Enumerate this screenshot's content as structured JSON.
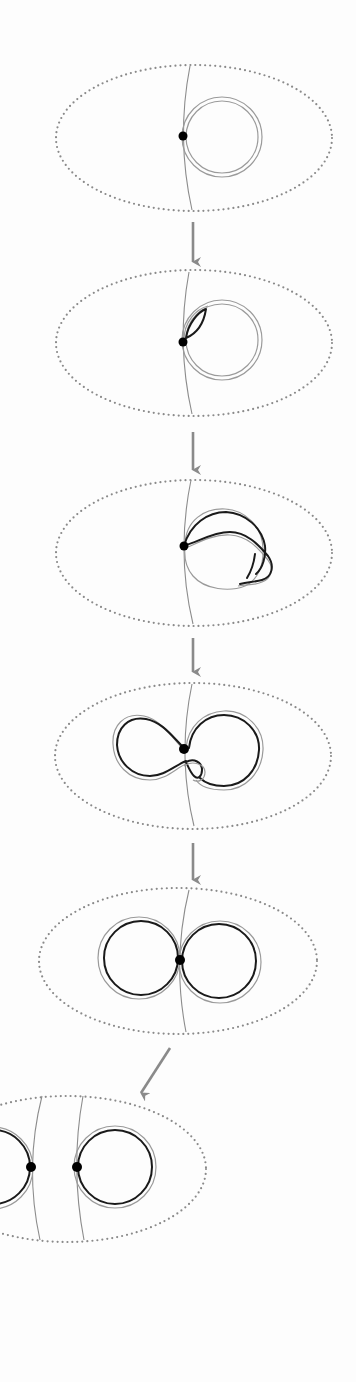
{
  "diagram": {
    "title": "",
    "colors": {
      "background": "#fdfdfd",
      "ellipse_dots": "#8a8a8a",
      "curve": "#8c8c8c",
      "ring_light": "#9a9a9a",
      "strand_dark": "#1a1a1a",
      "point": "#000000",
      "arrow": "#8a8a8a"
    },
    "stages": [
      {
        "id": 1,
        "label": "",
        "ellipse": {
          "cx": 194,
          "cy": 138,
          "rx": 138,
          "ry": 73
        },
        "points": [
          [
            183,
            136
          ]
        ],
        "shape": "single-doubled-circle"
      },
      {
        "id": 2,
        "label": "",
        "ellipse": {
          "cx": 194,
          "cy": 343,
          "rx": 138,
          "ry": 73
        },
        "points": [
          [
            183,
            342
          ]
        ],
        "shape": "doubled-circle-with-inner-leaf"
      },
      {
        "id": 3,
        "label": "",
        "ellipse": {
          "cx": 194,
          "cy": 553,
          "rx": 138,
          "ry": 73
        },
        "points": [
          [
            184,
            546
          ]
        ],
        "shape": "twisted-loop"
      },
      {
        "id": 4,
        "label": "",
        "ellipse": {
          "cx": 193,
          "cy": 756,
          "rx": 138,
          "ry": 73
        },
        "points": [
          [
            184,
            749
          ]
        ],
        "shape": "figure-eight-with-crossing"
      },
      {
        "id": 5,
        "label": "",
        "ellipse": {
          "cx": 178,
          "cy": 961,
          "rx": 139,
          "ry": 73
        },
        "points": [
          [
            180,
            960
          ]
        ],
        "shape": "two-tangent-circles"
      },
      {
        "id": 6,
        "label": "",
        "ellipse": {
          "cx": 67,
          "cy": 1169,
          "rx": 139,
          "ry": 73
        },
        "points": [
          [
            31,
            1167
          ],
          [
            77,
            1167
          ]
        ],
        "shape": "two-separated-circles"
      }
    ],
    "arrows": [
      {
        "from": "stage-1",
        "to": "stage-2",
        "direction": "down"
      },
      {
        "from": "stage-2",
        "to": "stage-3",
        "direction": "down"
      },
      {
        "from": "stage-3",
        "to": "stage-4",
        "direction": "down"
      },
      {
        "from": "stage-4",
        "to": "stage-5",
        "direction": "down"
      },
      {
        "from": "stage-5",
        "to": "stage-6",
        "direction": "down-left"
      }
    ]
  }
}
